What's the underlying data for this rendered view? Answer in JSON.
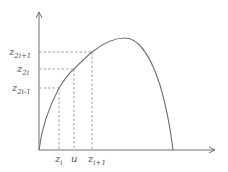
{
  "diagram": {
    "type": "function-plot-with-interpolation-markers",
    "colors": {
      "axis": "#707070",
      "curve": "#707070",
      "guide": "#8a8a8a",
      "text": "#555555"
    },
    "y_labels": [
      {
        "base": "z",
        "sub": "2i+1",
        "y": 52
      },
      {
        "base": "z",
        "sub": "2i",
        "y": 69
      },
      {
        "base": "z",
        "sub": "2i-1",
        "y": 88
      }
    ],
    "x_labels": [
      {
        "base": "z",
        "sub": "i",
        "x": 59
      },
      {
        "base": "u",
        "sub": "",
        "x": 74
      },
      {
        "base": "z",
        "sub": "i+1",
        "x": 92
      }
    ]
  }
}
